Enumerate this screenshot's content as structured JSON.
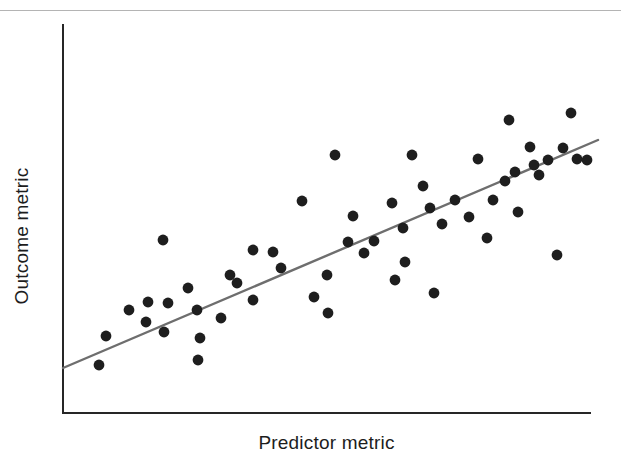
{
  "figure": {
    "background": "#ffffff",
    "top_rule_color": "#b4b4b4"
  },
  "axes": {
    "x_label": "Predictor metric",
    "y_label": "Outcome metric",
    "axis_color": "#262626",
    "axis_width": 2,
    "plot_left": 62,
    "plot_right": 591,
    "plot_top": 24,
    "plot_bottom": 414
  },
  "marker": {
    "color": "#1e1e1e",
    "radius": 5.4
  },
  "trendline": {
    "color": "#6e6e6e",
    "width": 2.4,
    "x1": 63,
    "y1": 368,
    "x2": 598,
    "y2": 140
  },
  "chart_data": {
    "type": "scatter",
    "title": "",
    "xlabel": "Predictor metric",
    "ylabel": "Outcome metric",
    "grid": false,
    "legend": false,
    "xlim": [
      0,
      100
    ],
    "ylim": [
      0,
      100
    ],
    "tick_labels": {
      "x": [],
      "y": []
    },
    "series": [
      {
        "name": "observations",
        "color": "#1e1e1e",
        "points": [
          [
            7.0,
            12.1
          ],
          [
            8.4,
            27.7
          ],
          [
            12.7,
            35.0
          ],
          [
            15.9,
            28.7
          ],
          [
            16.2,
            33.5
          ],
          [
            19.1,
            49.6
          ],
          [
            19.3,
            24.0
          ],
          [
            20.0,
            31.3
          ],
          [
            23.8,
            35.0
          ],
          [
            25.6,
            29.4
          ],
          [
            25.8,
            16.5
          ],
          [
            26.1,
            22.1
          ],
          [
            30.0,
            27.0
          ],
          [
            31.8,
            37.8
          ],
          [
            33.1,
            35.9
          ],
          [
            36.1,
            31.4
          ],
          [
            36.2,
            43.8
          ],
          [
            39.9,
            43.2
          ],
          [
            41.5,
            39.1
          ],
          [
            45.4,
            55.9
          ],
          [
            47.6,
            32.7
          ],
          [
            50.0,
            38.2
          ],
          [
            50.3,
            28.7
          ],
          [
            51.6,
            64.7
          ],
          [
            54.1,
            44.5
          ],
          [
            55.0,
            50.8
          ],
          [
            57.1,
            41.8
          ],
          [
            58.9,
            44.6
          ],
          [
            62.4,
            54.0
          ],
          [
            63.0,
            35.6
          ],
          [
            64.5,
            48.0
          ],
          [
            64.9,
            40.4
          ],
          [
            66.2,
            65.0
          ],
          [
            68.2,
            56.4
          ],
          [
            69.4,
            50.9
          ],
          [
            70.2,
            30.0
          ],
          [
            71.7,
            46.8
          ],
          [
            74.2,
            52.3
          ],
          [
            76.9,
            46.3
          ],
          [
            78.6,
            60.4
          ],
          [
            80.2,
            41.5
          ],
          [
            81.4,
            50.6
          ],
          [
            83.7,
            55.4
          ],
          [
            84.4,
            72.6
          ],
          [
            85.5,
            59.0
          ],
          [
            86.2,
            48.6
          ],
          [
            88.4,
            63.1
          ],
          [
            89.1,
            58.5
          ],
          [
            90.1,
            55.5
          ],
          [
            91.8,
            66.3
          ],
          [
            93.6,
            44.8
          ],
          [
            94.7,
            64.2
          ],
          [
            96.2,
            74.1
          ],
          [
            97.2,
            60.4
          ],
          [
            99.2,
            60.3
          ]
        ],
        "pixel_points": [
          [
            99,
            365
          ],
          [
            106,
            336
          ],
          [
            129,
            310
          ],
          [
            146,
            322
          ],
          [
            148,
            302
          ],
          [
            163,
            240
          ],
          [
            164,
            332
          ],
          [
            168,
            303
          ],
          [
            188,
            288
          ],
          [
            197,
            310
          ],
          [
            198,
            360
          ],
          [
            200,
            338
          ],
          [
            221,
            318
          ],
          [
            230,
            275
          ],
          [
            237,
            283
          ],
          [
            253,
            300
          ],
          [
            253,
            250
          ],
          [
            273,
            252
          ],
          [
            281,
            268
          ],
          [
            302,
            201
          ],
          [
            314,
            297
          ],
          [
            327,
            275
          ],
          [
            328,
            313
          ],
          [
            335,
            155
          ],
          [
            348,
            242
          ],
          [
            353,
            216
          ],
          [
            364,
            253
          ],
          [
            374,
            241
          ],
          [
            392,
            203
          ],
          [
            395,
            280
          ],
          [
            403,
            228
          ],
          [
            405,
            262
          ],
          [
            412,
            155
          ],
          [
            423,
            186
          ],
          [
            430,
            208
          ],
          [
            434,
            293
          ],
          [
            442,
            224
          ],
          [
            455,
            200
          ],
          [
            469,
            217
          ],
          [
            478,
            159
          ],
          [
            487,
            238
          ],
          [
            493,
            200
          ],
          [
            505,
            181
          ],
          [
            509,
            120
          ],
          [
            515,
            172
          ],
          [
            518,
            212
          ],
          [
            530,
            147
          ],
          [
            534,
            165
          ],
          [
            539,
            175
          ],
          [
            548,
            160
          ],
          [
            557,
            255
          ],
          [
            563,
            148
          ],
          [
            571,
            113
          ],
          [
            577,
            159
          ],
          [
            587,
            160
          ]
        ]
      }
    ]
  }
}
